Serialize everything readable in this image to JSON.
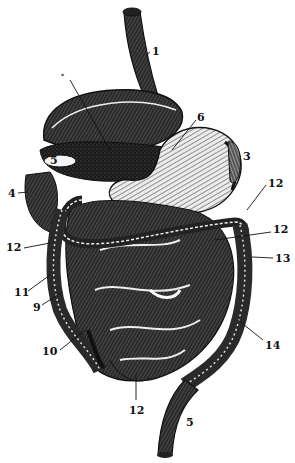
{
  "figure": {
    "style": {
      "ink": "#151515",
      "paper": "#ffffff",
      "highlight": "#f4f4f4"
    },
    "labels": [
      {
        "id": "l1",
        "text": "1",
        "x": 152,
        "y": 46
      },
      {
        "id": "l2",
        "text": "*",
        "x": 61,
        "y": 73,
        "small": true
      },
      {
        "id": "l3",
        "text": "3",
        "x": 243,
        "y": 151
      },
      {
        "id": "l4",
        "text": "4",
        "x": 8,
        "y": 188
      },
      {
        "id": "l5a",
        "text": "5",
        "x": 50,
        "y": 158
      },
      {
        "id": "l5b",
        "text": "5",
        "x": 186,
        "y": 417
      },
      {
        "id": "l6",
        "text": "6",
        "x": 197,
        "y": 114
      },
      {
        "id": "l9",
        "text": "9",
        "x": 33,
        "y": 302
      },
      {
        "id": "l10",
        "text": "10",
        "x": 42,
        "y": 346
      },
      {
        "id": "l11",
        "text": "11",
        "x": 14,
        "y": 287
      },
      {
        "id": "l12a",
        "text": "12",
        "x": 8,
        "y": 244
      },
      {
        "id": "l12b",
        "text": "12",
        "x": 268,
        "y": 180
      },
      {
        "id": "l12c",
        "text": "12",
        "x": 273,
        "y": 226
      },
      {
        "id": "l12d",
        "text": "12",
        "x": 129,
        "y": 407
      },
      {
        "id": "l13",
        "text": "13",
        "x": 275,
        "y": 253
      },
      {
        "id": "l14",
        "text": "14",
        "x": 265,
        "y": 342
      }
    ]
  }
}
